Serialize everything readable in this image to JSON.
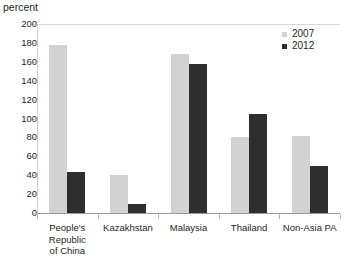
{
  "chart_data": {
    "type": "bar",
    "title": "",
    "ylabel": "percent",
    "xlabel": "",
    "ylim": [
      0,
      200
    ],
    "ytick_step": 20,
    "yticks": [
      "0",
      "20",
      "40",
      "60",
      "80",
      "100",
      "120",
      "140",
      "160",
      "180",
      "200"
    ],
    "grid": false,
    "legend_position": "top-right",
    "categories": [
      "People's Republic of China",
      "Kazakhstan",
      "Malaysia",
      "Thailand",
      "Non-Asia PA"
    ],
    "category_lines": [
      [
        "People's",
        "Republic",
        "of China"
      ],
      [
        "Kazakhstan"
      ],
      [
        "Malaysia"
      ],
      [
        "Thailand"
      ],
      [
        "Non-Asia PA"
      ]
    ],
    "series": [
      {
        "name": "2007",
        "color": "#d2d2d2",
        "values": [
          178,
          40,
          168,
          80,
          81
        ]
      },
      {
        "name": "2012",
        "color": "#2e2e2e",
        "values": [
          43,
          10,
          158,
          105,
          50
        ]
      }
    ]
  }
}
